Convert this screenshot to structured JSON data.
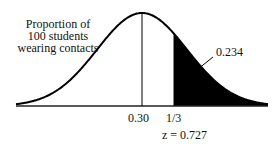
{
  "diagram": {
    "type": "normal-curve",
    "title_lines": [
      "Proportion of",
      "100 students",
      "wearing contacts"
    ],
    "mean_label": "0.30",
    "cutoff_label": "1/3",
    "z_label": "z = 0.727",
    "area_label": "0.234",
    "shaded_region": "right tail beyond 1/3"
  },
  "chart_data": {
    "type": "area",
    "title": "Proportion of 100 students wearing contacts",
    "distribution": "normal",
    "mean": 0.3,
    "cutoff": 0.3333,
    "z": 0.727,
    "tail_area": 0.234,
    "tick_labels": [
      "0.30",
      "1/3"
    ],
    "annotations": [
      "0.234",
      "z = 0.727"
    ]
  }
}
